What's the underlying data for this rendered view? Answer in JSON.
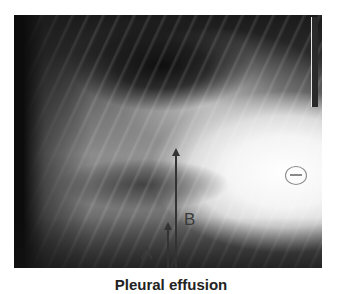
{
  "figure": {
    "image_alt": "Lateral chest radiograph",
    "annotations": {
      "arrow_a": {
        "label": "A"
      },
      "arrow_b": {
        "label": "B"
      }
    },
    "caption": "Pleural effusion"
  }
}
